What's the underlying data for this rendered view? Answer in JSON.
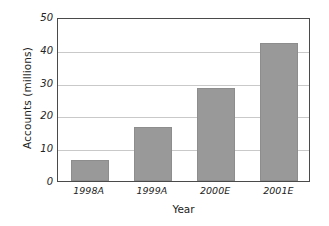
{
  "chart_data": {
    "type": "bar",
    "title": "",
    "xlabel": "Year",
    "ylabel": "Accounts (millions)",
    "categories": [
      "1998A",
      "1999A",
      "2000E",
      "2001E"
    ],
    "values": [
      6.5,
      16.5,
      28.5,
      42
    ],
    "ylim": [
      0,
      50
    ],
    "yticks": [
      0,
      10,
      20,
      30,
      40,
      50
    ],
    "ytick_labels": [
      "0",
      "10",
      "20",
      "30",
      "40",
      "50"
    ],
    "grid": "horizontal",
    "legend": "none",
    "series": [
      {
        "name": "Accounts",
        "values": [
          6.5,
          16.5,
          28.5,
          42
        ]
      }
    ],
    "colors": {
      "bar_fill": "#999999",
      "bar_edge": "#8d8d8d",
      "gridline": "#c9c9c9",
      "frame": "#4a4a4a",
      "background": "#ffffff",
      "text": "#222222"
    }
  }
}
